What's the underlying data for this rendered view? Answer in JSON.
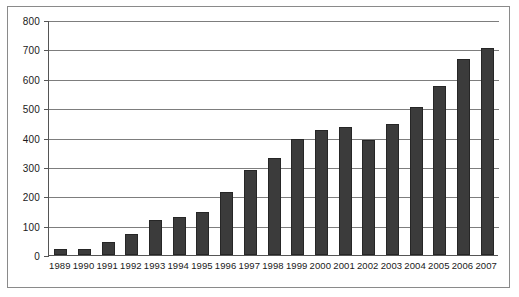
{
  "chart_data": {
    "type": "bar",
    "title": "",
    "subtitle": "",
    "xlabel": "",
    "ylabel": "",
    "ylim": [
      0,
      800
    ],
    "ytick_values": [
      0,
      100,
      200,
      300,
      400,
      500,
      600,
      700,
      800
    ],
    "ytick_labels": [
      "0",
      "100",
      "200",
      "300",
      "400",
      "500",
      "600",
      "700",
      "800"
    ],
    "grid": true,
    "legend": null,
    "bar_color": "#3b3b3b",
    "bar_edge_color": "#262626",
    "gridline_color": "#7d7d7d",
    "axis_color": "#555555",
    "frame_color": "#8a8a8a",
    "background_color": "#ffffff",
    "categories": [
      "1989",
      "1990",
      "1991",
      "1992",
      "1993",
      "1994",
      "1995",
      "1996",
      "1997",
      "1998",
      "1999",
      "2000",
      "2001",
      "2002",
      "2003",
      "2004",
      "2005",
      "2006",
      "2007"
    ],
    "values": [
      22,
      22,
      45,
      70,
      120,
      130,
      148,
      215,
      290,
      330,
      395,
      425,
      435,
      392,
      445,
      505,
      575,
      668,
      705
    ]
  }
}
